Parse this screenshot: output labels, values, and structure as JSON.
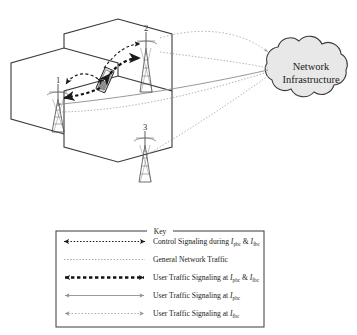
{
  "figure": {
    "type": "cellular-handoff-network-diagram",
    "cloud": {
      "label_line1": "Network",
      "label_line2": "Infrastructure",
      "fill_color": "#e8e8e8",
      "stroke_color": "#3a3a3a"
    },
    "cells": [
      {
        "id": "cell-left",
        "tower_label": "1"
      },
      {
        "id": "cell-top",
        "tower_label": "2"
      },
      {
        "id": "cell-bottom",
        "tower_label": "3"
      }
    ],
    "mobile_device": {
      "name": "mobile-handset",
      "position_note": "at boundary between cell 1 and cell 2"
    },
    "colors": {
      "hexagon_stroke": "#3a3a3a",
      "tower_stroke": "#4a4a4a",
      "dark_signal": "#1a1a1a",
      "light_signal": "#9a9a9a",
      "mid_signal": "#777777"
    }
  },
  "key": {
    "title": "Key",
    "entries": [
      {
        "id": "control-signaling",
        "style": "dotted-thin-double-arrow",
        "text_before": "Control Signaling during ",
        "sym1": "I",
        "sub1": "pbc",
        "text_mid": " & ",
        "sym2": "I",
        "sub2": "fbc",
        "text_after": ""
      },
      {
        "id": "general-network-traffic",
        "style": "dotted-plain",
        "text_before": "General Network Traffic",
        "sym1": "",
        "sub1": "",
        "text_mid": "",
        "sym2": "",
        "sub2": "",
        "text_after": ""
      },
      {
        "id": "user-traffic-both",
        "style": "dashed-thick-double-arrow",
        "text_before": "User Traffic Signaling at ",
        "sym1": "I",
        "sub1": "pbc",
        "text_mid": " & ",
        "sym2": "I",
        "sub2": "fbc",
        "text_after": ""
      },
      {
        "id": "user-traffic-pbc",
        "style": "solid-thin-double-arrow",
        "text_before": "User Traffic Signaling at ",
        "sym1": "I",
        "sub1": "pbc",
        "text_mid": "",
        "sym2": "",
        "sub2": "",
        "text_after": ""
      },
      {
        "id": "user-traffic-fbc",
        "style": "dotted-light-double-arrow",
        "text_before": "User Traffic Signaling at ",
        "sym1": "I",
        "sub1": "fbc",
        "text_mid": "",
        "sym2": "",
        "sub2": "",
        "text_after": ""
      }
    ]
  }
}
